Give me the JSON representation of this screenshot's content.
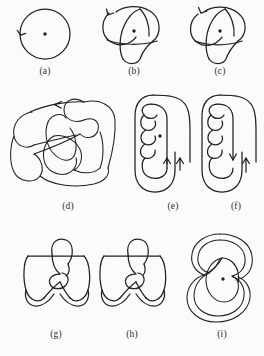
{
  "figure": {
    "background_color": "#fbfbfb",
    "ink_color": "#231f20",
    "panel_count": 9,
    "panels": [
      {
        "id": "a",
        "caption": "(a)",
        "description": "unknot-circle-with-basepoint",
        "has_basepoint": true,
        "arrow_count": 1,
        "arrow_direction": "down-left",
        "crossings": 0
      },
      {
        "id": "b",
        "caption": "(b)",
        "description": "trefoil-knot-with-basepoint",
        "has_basepoint": true,
        "arrow_count": 1,
        "arrow_direction": "left",
        "crossings": 3
      },
      {
        "id": "c",
        "caption": "(c)",
        "description": "trefoil-knot-mirror-with-basepoint",
        "has_basepoint": true,
        "arrow_count": 1,
        "arrow_direction": "left",
        "crossings": 3
      },
      {
        "id": "d",
        "caption": "(d)",
        "description": "complex-knot-diagram-many-crossings",
        "has_basepoint": false,
        "arrow_count": 1,
        "arrow_direction": "left",
        "crossings": 12
      },
      {
        "id": "e",
        "caption": "(e)",
        "description": "twisted-band-three-twists-with-basepoint",
        "has_basepoint": true,
        "arrow_count": 2,
        "arrow_direction": "up-up",
        "crossings": 3
      },
      {
        "id": "f",
        "caption": "(f)",
        "description": "twisted-band-three-twists-antiparallel",
        "has_basepoint": false,
        "arrow_count": 2,
        "arrow_direction": "down-up",
        "crossings": 3
      },
      {
        "id": "g",
        "caption": "(g)",
        "description": "figure-eight-style-knot-left",
        "has_basepoint": false,
        "arrow_count": 0,
        "arrow_direction": "none",
        "crossings": 4
      },
      {
        "id": "h",
        "caption": "(h)",
        "description": "figure-eight-style-knot-right",
        "has_basepoint": false,
        "arrow_count": 0,
        "arrow_direction": "none",
        "crossings": 4
      },
      {
        "id": "i",
        "caption": "(i)",
        "description": "nested-spiral-knot-with-basepoint",
        "has_basepoint": true,
        "arrow_count": 0,
        "arrow_direction": "none",
        "crossings": 4
      }
    ]
  }
}
